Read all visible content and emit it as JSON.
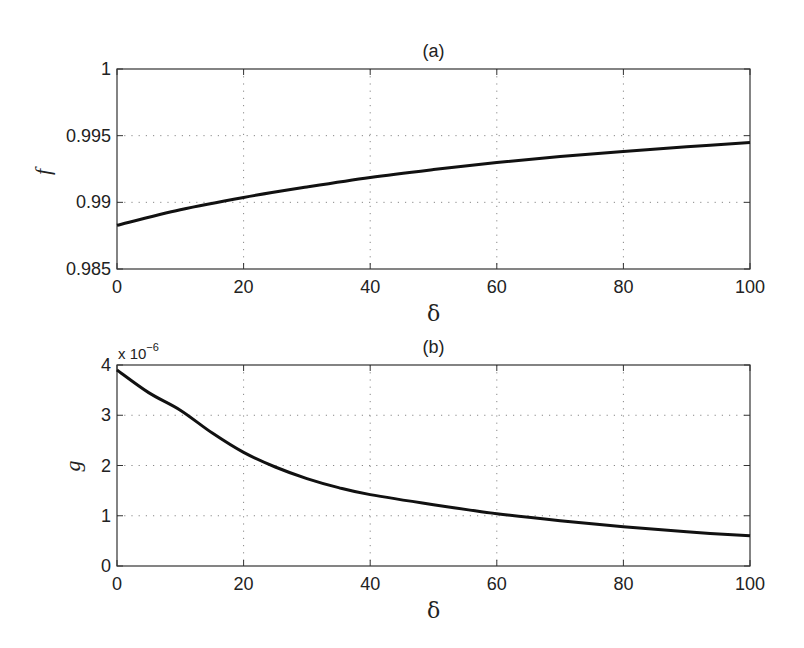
{
  "chart_data": [
    {
      "type": "line",
      "title": "(a)",
      "xlabel": "δ",
      "ylabel": "f",
      "xlim": [
        0,
        100
      ],
      "ylim": [
        0.985,
        1
      ],
      "xticks": [
        0,
        20,
        40,
        60,
        80,
        100
      ],
      "xtick_labels": [
        "0",
        "20",
        "40",
        "60",
        "80",
        "100"
      ],
      "yticks": [
        0.985,
        0.99,
        0.995,
        1
      ],
      "ytick_labels": [
        "0.985",
        "0.99",
        "0.995",
        "1"
      ],
      "grid": true,
      "grid_style": "dotted",
      "series": [
        {
          "name": "f",
          "color": "#111111",
          "x": [
            0,
            10,
            20,
            30,
            40,
            50,
            60,
            70,
            80,
            90,
            100
          ],
          "y": [
            0.98828,
            0.98945,
            0.99037,
            0.99115,
            0.99187,
            0.99246,
            0.99299,
            0.99343,
            0.99381,
            0.99416,
            0.99448
          ]
        }
      ]
    },
    {
      "type": "line",
      "title": "(b)",
      "xlabel": "δ",
      "ylabel": "g",
      "y_multiplier": "x 10",
      "y_multiplier_exp": "−6",
      "xlim": [
        0,
        100
      ],
      "ylim": [
        0,
        4
      ],
      "xticks": [
        0,
        20,
        40,
        60,
        80,
        100
      ],
      "xtick_labels": [
        "0",
        "20",
        "40",
        "60",
        "80",
        "100"
      ],
      "yticks": [
        0,
        1,
        2,
        3,
        4
      ],
      "ytick_labels": [
        "0",
        "1",
        "2",
        "3",
        "4"
      ],
      "grid": true,
      "grid_style": "dotted",
      "series": [
        {
          "name": "g (×10^-6)",
          "color": "#111111",
          "x": [
            0,
            5,
            10,
            15,
            20,
            25,
            30,
            35,
            40,
            50,
            60,
            70,
            80,
            90,
            100
          ],
          "y": [
            3.9,
            3.45,
            3.1,
            2.65,
            2.26,
            1.97,
            1.74,
            1.56,
            1.42,
            1.22,
            1.04,
            0.9,
            0.78,
            0.68,
            0.6
          ]
        }
      ]
    }
  ]
}
